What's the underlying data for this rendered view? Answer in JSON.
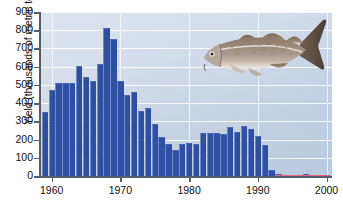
{
  "chart_data": {
    "type": "bar",
    "title": "",
    "xlabel": "",
    "ylabel": "Yield (thousands of metric tons)",
    "xlim": [
      1958.3,
      2000.8
    ],
    "ylim": [
      0,
      900
    ],
    "grid": true,
    "legend": null,
    "x_tick_labels": [
      "1960",
      "1970",
      "1980",
      "1990",
      "2000"
    ],
    "x_ticks": [
      1960,
      1970,
      1980,
      1990,
      2000
    ],
    "y_tick_labels": [
      "0",
      "100",
      "200",
      "300",
      "400",
      "500",
      "600",
      "700",
      "800",
      "900"
    ],
    "y_ticks": [
      0,
      100,
      200,
      300,
      400,
      500,
      600,
      700,
      800,
      900
    ],
    "bar_color": "#2f4fa2",
    "baseline_marker_color": "#e8657f",
    "background_color": "#cfd9e7",
    "gridline_color": "#ffffff",
    "categories": [
      1959,
      1960,
      1961,
      1962,
      1963,
      1964,
      1965,
      1966,
      1967,
      1968,
      1969,
      1970,
      1971,
      1972,
      1973,
      1974,
      1975,
      1976,
      1977,
      1978,
      1979,
      1980,
      1981,
      1982,
      1983,
      1984,
      1985,
      1986,
      1987,
      1988,
      1989,
      1990,
      1991,
      1992,
      1993,
      1994,
      1995,
      1996,
      1997,
      1998,
      1999,
      2000
    ],
    "values": [
      353,
      470,
      508,
      508,
      508,
      602,
      546,
      524,
      614,
      810,
      753,
      523,
      443,
      460,
      355,
      373,
      288,
      214,
      176,
      141,
      174,
      180,
      174,
      234,
      237,
      234,
      232,
      270,
      244,
      272,
      258,
      220,
      172,
      35,
      11,
      4,
      4,
      3,
      9,
      4,
      3,
      8
    ],
    "annotations": [
      {
        "name": "atlantic-cod-illustration",
        "description": "Illustration of an Atlantic cod swimming, positioned upper right of plot"
      }
    ]
  },
  "figure": {
    "fish_alt": "atlantic-cod-illustration"
  }
}
